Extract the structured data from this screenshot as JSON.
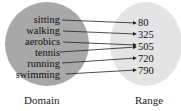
{
  "diagram": {
    "type": "mapping",
    "domain": {
      "title": "Domain",
      "items": [
        "sitting",
        "walking",
        "aerobics",
        "tennis",
        "running",
        "swimming"
      ]
    },
    "range": {
      "title": "Range",
      "items": [
        "80",
        "325",
        "505",
        "720",
        "790"
      ]
    },
    "mappings": [
      {
        "from": "sitting",
        "to": "80"
      },
      {
        "from": "walking",
        "to": "325"
      },
      {
        "from": "aerobics",
        "to": "505"
      },
      {
        "from": "tennis",
        "to": "505"
      },
      {
        "from": "running",
        "to": "720"
      },
      {
        "from": "swimming",
        "to": "790"
      }
    ],
    "colors": {
      "domain_fill": "#a8a8a8",
      "range_fill": "#e4e4e4",
      "arrow": "#222222"
    }
  }
}
